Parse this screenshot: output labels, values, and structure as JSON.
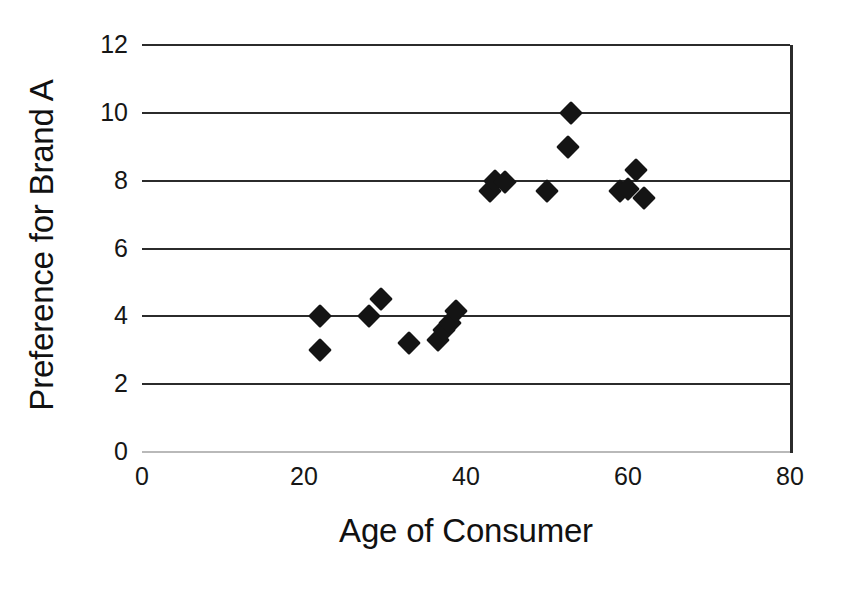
{
  "chart_data": {
    "type": "scatter",
    "title": "",
    "xlabel": "Age of Consumer",
    "ylabel": "Preference for Brand A",
    "xlim": [
      0,
      80
    ],
    "ylim": [
      0,
      12
    ],
    "xticks": [
      0,
      20,
      40,
      60,
      80
    ],
    "yticks": [
      0,
      2,
      4,
      6,
      8,
      10,
      12
    ],
    "xtick_labels": [
      "0",
      "20",
      "40",
      "60",
      "80"
    ],
    "ytick_labels": [
      "0",
      "2",
      "4",
      "6",
      "8",
      "10",
      "12"
    ],
    "grid": "horizontal",
    "legend": "none",
    "marker": "filled-diamond",
    "marker_color": "#141414",
    "gridline_color": "#2b2b2b",
    "background_color": "#ffffff",
    "series": [
      {
        "name": "Consumers",
        "points": [
          {
            "x": 22.0,
            "y": 4.0
          },
          {
            "x": 22.0,
            "y": 3.0
          },
          {
            "x": 28.0,
            "y": 4.0
          },
          {
            "x": 29.5,
            "y": 4.5
          },
          {
            "x": 33.0,
            "y": 3.2
          },
          {
            "x": 36.5,
            "y": 3.3
          },
          {
            "x": 37.3,
            "y": 3.6
          },
          {
            "x": 38.0,
            "y": 3.8
          },
          {
            "x": 38.8,
            "y": 4.15
          },
          {
            "x": 43.0,
            "y": 7.7
          },
          {
            "x": 43.6,
            "y": 8.0
          },
          {
            "x": 44.8,
            "y": 7.95
          },
          {
            "x": 50.0,
            "y": 7.7
          },
          {
            "x": 52.6,
            "y": 9.0
          },
          {
            "x": 53.0,
            "y": 10.0
          },
          {
            "x": 59.0,
            "y": 7.7
          },
          {
            "x": 60.0,
            "y": 7.75
          },
          {
            "x": 61.0,
            "y": 8.3
          },
          {
            "x": 62.0,
            "y": 7.5
          }
        ]
      }
    ]
  }
}
